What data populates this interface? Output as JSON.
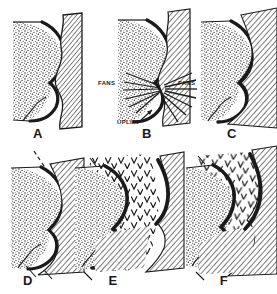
{
  "figure": {
    "type": "geological-cross-section-diagram",
    "background_color": "#ffffff",
    "ink_color": "#1a1a1a",
    "panel_count": 6
  },
  "panels": [
    {
      "id": "A",
      "label": "A",
      "label_x": 38,
      "label_y": 138,
      "annotations": []
    },
    {
      "id": "B",
      "label": "B",
      "label_x": 147,
      "label_y": 138,
      "annotations": [
        {
          "text": "FANS",
          "x": 98,
          "y": 85,
          "anchor": "start"
        },
        {
          "text": "FANS",
          "x": 178,
          "y": 85,
          "anchor": "start"
        },
        {
          "text": "UPLIFT",
          "x": 117,
          "y": 124,
          "anchor": "start"
        }
      ]
    },
    {
      "id": "C",
      "label": "C",
      "label_x": 232,
      "label_y": 138,
      "annotations": []
    },
    {
      "id": "D",
      "label": "D",
      "label_x": 28,
      "label_y": 285,
      "annotations": []
    },
    {
      "id": "E",
      "label": "E",
      "label_x": 113,
      "label_y": 285,
      "annotations": []
    },
    {
      "id": "F",
      "label": "F",
      "label_x": 224,
      "label_y": 285,
      "annotations": []
    }
  ],
  "legend_patterns": {
    "stipple": "stippled-sediment-fill",
    "hatch": "diagonal-hatch-basement-fill",
    "chevron": "v-pattern-volcanic-fill",
    "bold_curve": "bold-lobed-fault-contact"
  }
}
